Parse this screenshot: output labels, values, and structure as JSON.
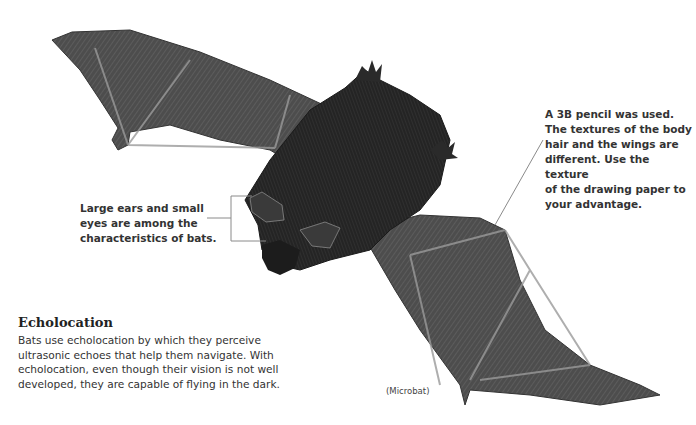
{
  "annotations": {
    "pencil_note": "A 3B pencil was used.\nThe textures of the body\nhair and the wings are\ndifferent. Use the texture\nof the drawing paper to\nyour advantage.",
    "ears_note": "Large ears and small\neyes are among the\ncharacteristics of bats."
  },
  "section": {
    "title": "Echolocation",
    "body": "Bats use echolocation by which they perceive\nultrasonic echoes that help them navigate. With\necholocation, even though their vision is not well\ndeveloped, they are capable of flying in the dark."
  },
  "caption": "(Microbat)",
  "illustration": {
    "subject": "pencil drawing of a microbat in flight",
    "colors": {
      "wing": "#4a4a4a",
      "body": "#262626",
      "bone": "#9a9a9a",
      "leader_line": "#8a8a8a"
    }
  }
}
